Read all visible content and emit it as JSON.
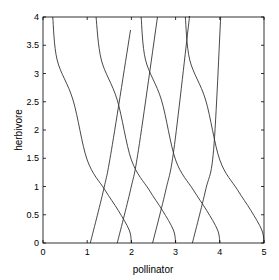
{
  "chart_data": {
    "type": "line",
    "title": "",
    "xlabel": "pollinator",
    "ylabel": "herbivore",
    "xlim": [
      0,
      5
    ],
    "ylim": [
      0,
      4
    ],
    "grid": false,
    "legend": null,
    "x_ticks": [
      "0",
      "1",
      "2",
      "3",
      "4",
      "5"
    ],
    "y_ticks": [
      "0",
      "0.5",
      "1",
      "1.5",
      "2",
      "2.5",
      "3",
      "3.5",
      "4"
    ],
    "series": [
      {
        "name": "decreasing-1",
        "points": [
          [
            0.22,
            4.0
          ],
          [
            0.32,
            3.24
          ],
          [
            0.68,
            2.53
          ],
          [
            1.0,
            1.47
          ],
          [
            1.4,
            0.94
          ],
          [
            1.7,
            0.58
          ],
          [
            1.95,
            0.23
          ],
          [
            2.0,
            0.0
          ]
        ]
      },
      {
        "name": "decreasing-2",
        "points": [
          [
            1.2,
            4.0
          ],
          [
            1.32,
            3.24
          ],
          [
            1.68,
            2.53
          ],
          [
            2.0,
            1.47
          ],
          [
            2.4,
            0.94
          ],
          [
            2.7,
            0.58
          ],
          [
            2.95,
            0.23
          ],
          [
            3.0,
            0.0
          ]
        ]
      },
      {
        "name": "decreasing-3",
        "points": [
          [
            2.22,
            4.0
          ],
          [
            2.32,
            3.24
          ],
          [
            2.68,
            2.53
          ],
          [
            3.0,
            1.47
          ],
          [
            3.4,
            0.94
          ],
          [
            3.7,
            0.58
          ],
          [
            3.95,
            0.23
          ],
          [
            4.0,
            0.0
          ]
        ]
      },
      {
        "name": "decreasing-4",
        "points": [
          [
            3.22,
            4.0
          ],
          [
            3.32,
            3.24
          ],
          [
            3.68,
            2.53
          ],
          [
            4.0,
            1.47
          ],
          [
            4.4,
            0.94
          ],
          [
            4.7,
            0.58
          ],
          [
            4.95,
            0.23
          ],
          [
            5.0,
            0.0
          ]
        ]
      },
      {
        "name": "increasing-1",
        "points": [
          [
            1.07,
            0.0
          ],
          [
            1.37,
            0.94
          ],
          [
            1.55,
            1.65
          ],
          [
            1.98,
            3.77
          ]
        ]
      },
      {
        "name": "increasing-2",
        "points": [
          [
            1.68,
            0.0
          ],
          [
            1.98,
            0.94
          ],
          [
            2.16,
            1.65
          ],
          [
            2.59,
            4.0
          ]
        ]
      },
      {
        "name": "increasing-3",
        "points": [
          [
            2.48,
            0.0
          ],
          [
            2.78,
            0.94
          ],
          [
            2.96,
            1.65
          ],
          [
            3.28,
            3.77
          ],
          [
            3.31,
            4.0
          ]
        ]
      },
      {
        "name": "increasing-4",
        "points": [
          [
            3.38,
            0.0
          ],
          [
            3.68,
            0.94
          ],
          [
            3.86,
            1.65
          ],
          [
            4.02,
            4.0
          ]
        ]
      }
    ]
  },
  "colors": {
    "line": "#333333",
    "axis": "#000000",
    "background": "#ffffff"
  }
}
